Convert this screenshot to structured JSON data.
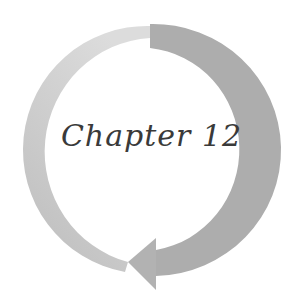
{
  "title": "Chapter 12",
  "graphic": {
    "shape": "circular-arrow",
    "direction": "clockwise",
    "colors": {
      "light_arc": "#d4d4d4",
      "dark_arc": "#ababab",
      "arrowhead": "#b5b5b5",
      "text": "#3a3a3a",
      "background": "#ffffff"
    }
  }
}
